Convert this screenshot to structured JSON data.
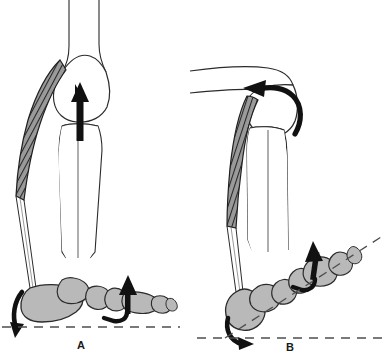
{
  "figure": {
    "width": 383,
    "height": 360,
    "background_color": "#ffffff"
  },
  "palette": {
    "outline": "#1a1a1a",
    "bone_fill": "#b9b9b9",
    "bone_outline": "#2b2b2b",
    "bone_white_fill": "#ffffff",
    "muscle_hatch_line": "#2e2e2e",
    "muscle_hatch_fill": "#8c8c8c",
    "arrow_fill": "#111111",
    "ground_dash": "#4d4d4d"
  },
  "panels": [
    {
      "id": "A",
      "label": "A",
      "label_x": 77,
      "label_y": 339,
      "description": "Knee extended, foot flat on ground",
      "bones": [
        {
          "name": "femur-shaft"
        },
        {
          "name": "femoral-condyle"
        },
        {
          "name": "tibia"
        },
        {
          "name": "fibula"
        },
        {
          "name": "calcaneus"
        },
        {
          "name": "talus"
        },
        {
          "name": "navicular"
        },
        {
          "name": "cuneiform"
        },
        {
          "name": "metatarsal"
        },
        {
          "name": "phalanges"
        }
      ],
      "muscle": {
        "name": "gastrocnemius",
        "style": "diagonal-hatch"
      },
      "arrows": [
        {
          "name": "knee-extension-arrow",
          "type": "straight",
          "direction": "up"
        },
        {
          "name": "heel-rotation-arrow",
          "type": "curved",
          "direction": "down-ccw"
        },
        {
          "name": "toe-lift-arrow",
          "type": "straight-hooked",
          "direction": "up"
        }
      ],
      "reference_lines": [
        {
          "name": "ground-line",
          "style": "dashed",
          "orientation": "horizontal"
        }
      ]
    },
    {
      "id": "B",
      "label": "B",
      "label_x": 286,
      "label_y": 341,
      "description": "Knee flexed, foot plantarflexed and raised",
      "bones": [
        {
          "name": "femur-shaft"
        },
        {
          "name": "femoral-condyle"
        },
        {
          "name": "tibia"
        },
        {
          "name": "fibula"
        },
        {
          "name": "calcaneus"
        },
        {
          "name": "talus"
        },
        {
          "name": "navicular"
        },
        {
          "name": "cuneiform"
        },
        {
          "name": "metatarsal"
        },
        {
          "name": "phalanges"
        }
      ],
      "muscle": {
        "name": "gastrocnemius",
        "style": "diagonal-hatch"
      },
      "arrows": [
        {
          "name": "knee-flexion-arrow",
          "type": "curved",
          "direction": "up-left-ccw"
        },
        {
          "name": "heel-rotation-arrow",
          "type": "curved",
          "direction": "down-right"
        },
        {
          "name": "toe-lift-arrow",
          "type": "straight-hooked",
          "direction": "up"
        }
      ],
      "reference_lines": [
        {
          "name": "foot-axis-line",
          "style": "dashed",
          "orientation": "inclined"
        },
        {
          "name": "ground-line",
          "style": "dashed",
          "orientation": "horizontal"
        }
      ]
    }
  ]
}
